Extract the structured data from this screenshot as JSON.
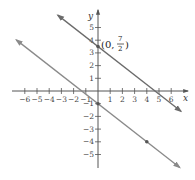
{
  "chart_data": {
    "type": "line",
    "title": "",
    "xlabel": "x",
    "ylabel": "y",
    "xlim": [
      -6.5,
      6.5
    ],
    "ylim": [
      -5.5,
      5.5
    ],
    "grid": false,
    "x_ticks": [
      -6,
      -5,
      -4,
      -3,
      -2,
      -1,
      1,
      2,
      3,
      4,
      5,
      6
    ],
    "y_ticks": [
      -5,
      -4,
      -3,
      -2,
      -1,
      1,
      2,
      3,
      4,
      5
    ],
    "x_tick_labels": [
      "−6",
      "−5",
      "−4",
      "−3",
      "−2",
      "−1",
      "1",
      "2",
      "3",
      "4",
      "5",
      "6"
    ],
    "y_tick_labels": [
      "−5",
      "−4",
      "−3",
      "−2",
      "−1",
      "1",
      "2",
      "3",
      "4",
      "5"
    ],
    "series": [
      {
        "name": "upper line",
        "equation": "y = -3/4 x + 7/2",
        "slope": -0.75,
        "intercept": 3.5,
        "x_range": [
          -3.3,
          6.8
        ],
        "marked_points": [
          [
            0,
            3.5
          ]
        ],
        "color": "#6b6b6b"
      },
      {
        "name": "lower line",
        "equation": "y = -3/4 x - 1",
        "slope": -0.75,
        "intercept": -1,
        "x_range": [
          -6.7,
          6.7
        ],
        "marked_points": [
          [
            0,
            -1
          ],
          [
            4,
            -4
          ]
        ],
        "color": "#8a8a8a"
      }
    ],
    "annotations": [
      {
        "text_prefix": "(0, ",
        "numerator": "7",
        "denominator": "2",
        "text_suffix": ")",
        "at": [
          0,
          3.5
        ]
      }
    ]
  },
  "labels": {
    "x_axis": "x",
    "y_axis": "y",
    "annotation_prefix": "(0,",
    "annotation_num": "7",
    "annotation_den": "2",
    "annotation_suffix": ")"
  }
}
